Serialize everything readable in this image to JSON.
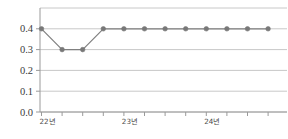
{
  "chart_data": {
    "type": "line",
    "title": "",
    "subtitle": "",
    "xlabel": "",
    "ylabel": "",
    "x": [
      0,
      1,
      2,
      3,
      4,
      5,
      6,
      7,
      8,
      9,
      10,
      11
    ],
    "categories": [
      "22년",
      "",
      "",
      "",
      "23년",
      "",
      "",
      "",
      "24년",
      "",
      "",
      ""
    ],
    "values": [
      0.4,
      0.3,
      0.3,
      0.4,
      0.4,
      0.4,
      0.4,
      0.4,
      0.4,
      0.4,
      0.4,
      0.4
    ],
    "series": [
      {
        "name": "",
        "values": [
          0.4,
          0.3,
          0.3,
          0.4,
          0.4,
          0.4,
          0.4,
          0.4,
          0.4,
          0.4,
          0.4,
          0.4
        ]
      }
    ],
    "ylim": [
      0.0,
      0.5
    ],
    "ytick_labels": [
      "0.0",
      "0.1",
      "0.2",
      "0.3",
      "0.4"
    ],
    "ytick_values": [
      0.0,
      0.1,
      0.2,
      0.3,
      0.4
    ],
    "xtick_labels": [
      "22년",
      "23년",
      "24년"
    ],
    "xtick_label_indices": [
      0,
      4,
      8
    ],
    "grid": true,
    "grid_axis": "y",
    "legend": false,
    "legend_position": "none",
    "annotations": []
  },
  "style": {
    "line_color": "#808080",
    "marker_color": "#787878",
    "grid_color": "#c8c8c8",
    "axis_color": "#9a9a9a",
    "text_color": "#3b3b3b",
    "background": "#ffffff"
  },
  "axes": {
    "y_axis_name": "value-axis",
    "x_axis_name": "year-axis"
  }
}
